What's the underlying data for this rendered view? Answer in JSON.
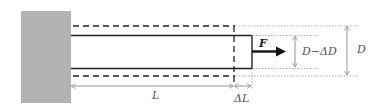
{
  "diagram": {
    "labels": {
      "force": "F",
      "length": "L",
      "elongation": "ΔL",
      "reduced_diameter": "D−ΔD",
      "diameter": "D"
    },
    "elements": {
      "wall": "fixed support",
      "original_bar": "dashed outline (original shape)",
      "deformed_bar": "solid outline (stretched, narrowed shape)",
      "force_arrow": "pulling force to the right"
    },
    "colors": {
      "wall": "#b3b3b3",
      "line": "#222222",
      "dim": "#888888",
      "text": "#555555"
    }
  }
}
